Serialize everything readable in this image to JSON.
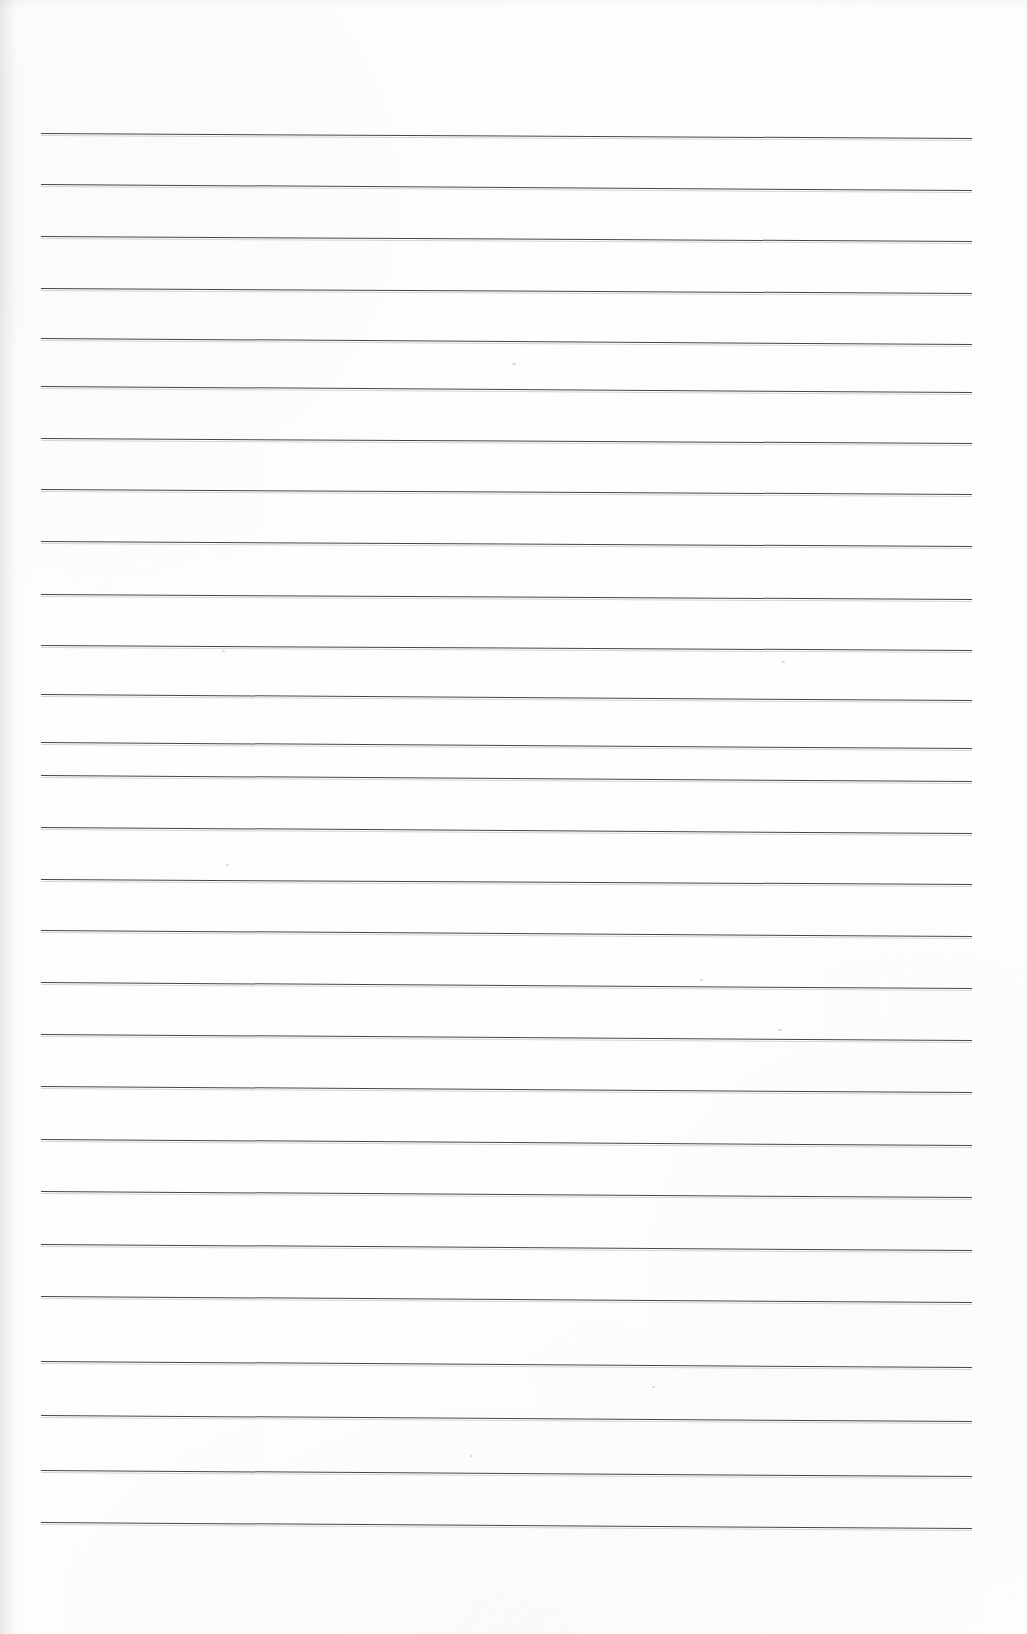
{
  "document": {
    "type": "scanned-lined-paper",
    "title": "Blank ruled notebook page",
    "content_text": "",
    "page_width": 1027,
    "page_height": 1634,
    "background_color": "#fdfdfd",
    "rule_color": "#3b3d40",
    "rule_thickness_px": 1.6,
    "rule_count": 27,
    "rule_left_x": 41,
    "rule_right_x": 972,
    "rule_first_y": 133,
    "rule_spacing_px": 53.5,
    "rule_slope_px": 5,
    "margin_left_px": 41,
    "margin_right_px": 55,
    "margin_top_px": 133,
    "margin_bottom_px": 111
  },
  "ruled_lines": [
    {
      "index": 1,
      "y_left": 133,
      "y_right": 138
    },
    {
      "index": 2,
      "y_left": 184,
      "y_right": 190
    },
    {
      "index": 3,
      "y_left": 236,
      "y_right": 241
    },
    {
      "index": 4,
      "y_left": 288,
      "y_right": 293
    },
    {
      "index": 5,
      "y_left": 338,
      "y_right": 344
    },
    {
      "index": 6,
      "y_left": 386,
      "y_right": 392
    },
    {
      "index": 7,
      "y_left": 438,
      "y_right": 443
    },
    {
      "index": 8,
      "y_left": 489,
      "y_right": 494
    },
    {
      "index": 9,
      "y_left": 541,
      "y_right": 546
    },
    {
      "index": 10,
      "y_left": 594,
      "y_right": 599
    },
    {
      "index": 11,
      "y_left": 645,
      "y_right": 650
    },
    {
      "index": 12,
      "y_left": 694,
      "y_right": 700
    },
    {
      "index": 13,
      "y_left": 742,
      "y_right": 748
    },
    {
      "index": 14,
      "y_left": 775,
      "y_right": 781
    },
    {
      "index": 15,
      "y_left": 827,
      "y_right": 833
    },
    {
      "index": 16,
      "y_left": 879,
      "y_right": 884
    },
    {
      "index": 17,
      "y_left": 930,
      "y_right": 936
    },
    {
      "index": 18,
      "y_left": 982,
      "y_right": 988
    },
    {
      "index": 19,
      "y_left": 1034,
      "y_right": 1040
    },
    {
      "index": 20,
      "y_left": 1086,
      "y_right": 1092
    },
    {
      "index": 21,
      "y_left": 1139,
      "y_right": 1145
    },
    {
      "index": 22,
      "y_left": 1191,
      "y_right": 1197
    },
    {
      "index": 23,
      "y_left": 1244,
      "y_right": 1250
    },
    {
      "index": 24,
      "y_left": 1296,
      "y_right": 1302
    },
    {
      "index": 25,
      "y_left": 1361,
      "y_right": 1367
    },
    {
      "index": 26,
      "y_left": 1415,
      "y_right": 1421
    },
    {
      "index": 27,
      "y_left": 1470,
      "y_right": 1476
    },
    {
      "index": 28,
      "y_left": 1522,
      "y_right": 1528
    }
  ],
  "artifacts": [
    {
      "name": "speck",
      "x": 512,
      "y": 363,
      "size": 4
    },
    {
      "name": "speck",
      "x": 782,
      "y": 661,
      "size": 3
    },
    {
      "name": "speck",
      "x": 222,
      "y": 650,
      "size": 3
    },
    {
      "name": "speck",
      "x": 226,
      "y": 864,
      "size": 3
    },
    {
      "name": "speck",
      "x": 700,
      "y": 979,
      "size": 3
    },
    {
      "name": "speck",
      "x": 778,
      "y": 1029,
      "size": 4
    },
    {
      "name": "speck",
      "x": 470,
      "y": 1455,
      "size": 3
    },
    {
      "name": "speck",
      "x": 652,
      "y": 1386,
      "size": 3
    }
  ]
}
